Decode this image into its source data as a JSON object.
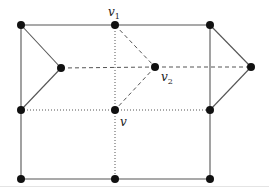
{
  "diagram": {
    "type": "graph",
    "labels": {
      "v1": {
        "base": "v",
        "sub": "1"
      },
      "v2": {
        "base": "v",
        "sub": "2"
      },
      "v": {
        "base": "v",
        "sub": ""
      }
    },
    "colors": {
      "node": "#111111",
      "edge": "#555555"
    },
    "nodes": [
      {
        "id": "tl",
        "x": 21,
        "y": 25
      },
      {
        "id": "v1",
        "x": 115,
        "y": 25
      },
      {
        "id": "tr",
        "x": 210,
        "y": 25
      },
      {
        "id": "lm",
        "x": 61,
        "y": 68
      },
      {
        "id": "v2",
        "x": 155,
        "y": 67
      },
      {
        "id": "rm",
        "x": 251,
        "y": 67
      },
      {
        "id": "ml",
        "x": 21,
        "y": 110
      },
      {
        "id": "v",
        "x": 115,
        "y": 110
      },
      {
        "id": "mr",
        "x": 210,
        "y": 110
      },
      {
        "id": "bl",
        "x": 21,
        "y": 179
      },
      {
        "id": "bm",
        "x": 115,
        "y": 179
      },
      {
        "id": "br",
        "x": 210,
        "y": 179
      }
    ],
    "edges": [
      {
        "from": "tl",
        "to": "v1",
        "style": "solid"
      },
      {
        "from": "v1",
        "to": "tr",
        "style": "solid"
      },
      {
        "from": "tl",
        "to": "bl",
        "style": "solid"
      },
      {
        "from": "tr",
        "to": "br",
        "style": "solid"
      },
      {
        "from": "bl",
        "to": "bm",
        "style": "solid"
      },
      {
        "from": "bm",
        "to": "br",
        "style": "solid"
      },
      {
        "from": "tl",
        "to": "lm",
        "style": "solid"
      },
      {
        "from": "lm",
        "to": "ml",
        "style": "solid"
      },
      {
        "from": "tr",
        "to": "rm",
        "style": "solid"
      },
      {
        "from": "rm",
        "to": "mr",
        "style": "solid"
      },
      {
        "from": "lm",
        "to": "v2",
        "style": "dashed"
      },
      {
        "from": "v2",
        "to": "rm",
        "style": "dashed"
      },
      {
        "from": "v1",
        "to": "v2",
        "style": "dashed"
      },
      {
        "from": "v2",
        "to": "v",
        "style": "dashed"
      },
      {
        "from": "v1",
        "to": "v",
        "style": "dotted"
      },
      {
        "from": "v",
        "to": "bm",
        "style": "dotted"
      },
      {
        "from": "ml",
        "to": "v",
        "style": "dotted"
      },
      {
        "from": "v",
        "to": "mr",
        "style": "dotted"
      }
    ]
  }
}
